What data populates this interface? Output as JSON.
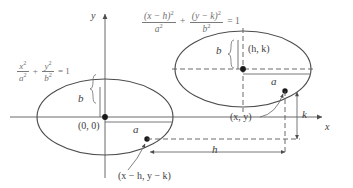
{
  "figure": {
    "background_color": "#ffffff",
    "stroke_color": "#4d4d4d",
    "equation_color": "#6f6f6f",
    "label_color": "#3d3d3d"
  },
  "axes": {
    "y_label": "y",
    "x_label": "x",
    "origin_x": 105,
    "origin_y": 117
  },
  "equations": {
    "origin_ellipse": {
      "term1_num": "x",
      "term1_num_sup": "2",
      "term1_den": "a",
      "term1_den_sup": "2",
      "plus": "+",
      "term2_num": "y",
      "term2_num_sup": "2",
      "term2_den": "b",
      "term2_den_sup": "2",
      "equals": "= 1"
    },
    "translated_ellipse": {
      "term1_num": "(x − h)",
      "term1_num_sup": "2",
      "term1_den": "a",
      "term1_den_sup": "2",
      "plus": "+",
      "term2_num": "(y − k)",
      "term2_num_sup": "2",
      "term2_den": "b",
      "term2_den_sup": "2",
      "equals": "= 1"
    }
  },
  "ellipse_origin": {
    "center_label": "(0, 0)",
    "semi_major_label": "a",
    "semi_minor_label": "b",
    "center_x": 105,
    "center_y": 117,
    "rx": 68,
    "ry": 38,
    "point_label": "(x − h, y − k)",
    "point_x": 147,
    "point_y": 139
  },
  "ellipse_translated": {
    "center_label": "(h, k)",
    "semi_major_label": "a",
    "semi_minor_label": "b",
    "center_x": 243,
    "center_y": 69,
    "rx": 68,
    "ry": 38,
    "point_label": "(x, y)",
    "point_x": 285,
    "point_y": 91
  },
  "dimensions": {
    "horizontal_shift_label": "h",
    "vertical_shift_label": "k"
  }
}
